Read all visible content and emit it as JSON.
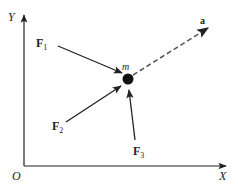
{
  "diagram": {
    "type": "force-diagram",
    "axes": {
      "origin_label": "O",
      "x_label": "X",
      "y_label": "Y"
    },
    "mass": {
      "label": "m"
    },
    "forces": [
      {
        "label": "F",
        "subscript": "1"
      },
      {
        "label": "F",
        "subscript": "2"
      },
      {
        "label": "F",
        "subscript": "3"
      }
    ],
    "acceleration": {
      "label": "a",
      "style": "dashed"
    },
    "colors": {
      "ink": "#222222",
      "dashed": "#666666",
      "background": "#ffffff"
    }
  }
}
